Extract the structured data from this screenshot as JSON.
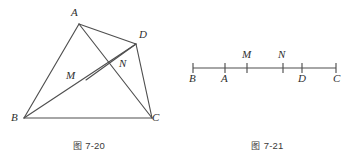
{
  "page": {
    "width": 357,
    "height": 164,
    "background": "#ffffff",
    "ink_color": "#4a4a4a",
    "label_color": "#2e2e2e"
  },
  "figures": [
    {
      "id": "figure-7-20",
      "caption": "图 7-20",
      "caption_cjk": "图",
      "caption_number": "7-20",
      "type": "geometry-diagram",
      "description": "Quadrilateral ABDC with cevians; M and N are interior intersection points",
      "points": [
        {
          "name": "A",
          "label": "A",
          "x": 79,
          "y": 24,
          "label_x": 71,
          "label_y": 7
        },
        {
          "name": "D",
          "label": "D",
          "x": 136,
          "y": 44,
          "label_x": 139,
          "label_y": 29
        },
        {
          "name": "N",
          "label": "N",
          "x": 115,
          "y": 67,
          "label_x": 119,
          "label_y": 58
        },
        {
          "name": "M",
          "label": "M",
          "x": 86,
          "y": 80,
          "label_x": 68,
          "label_y": 70
        },
        {
          "name": "B",
          "label": "B",
          "x": 24,
          "y": 118,
          "label_x": 12,
          "label_y": 113
        },
        {
          "name": "C",
          "label": "C",
          "x": 152,
          "y": 118,
          "label_x": 152,
          "label_y": 113
        }
      ],
      "segments": [
        {
          "from": "B",
          "to": "A",
          "name": "segment-BA"
        },
        {
          "from": "B",
          "to": "C",
          "name": "segment-BC"
        },
        {
          "from": "A",
          "to": "D",
          "name": "segment-AD"
        },
        {
          "from": "D",
          "to": "C",
          "name": "segment-DC"
        },
        {
          "from": "A",
          "to": "C",
          "name": "segment-AC"
        },
        {
          "from": "B",
          "to": "D",
          "name": "segment-BD"
        },
        {
          "from": "M",
          "to": "D",
          "name": "segment-MD"
        }
      ]
    },
    {
      "id": "figure-7-21",
      "caption": "图 7-21",
      "caption_cjk": "图",
      "caption_number": "7-21",
      "type": "number-line-diagram",
      "description": "Straight line with marked points B, A, M, N, D, C in order",
      "line": {
        "x1": 15,
        "y1": 68,
        "x2": 158,
        "y2": 68
      },
      "ticks": [
        {
          "name": "B",
          "label": "B",
          "x": 15,
          "label_side": "below"
        },
        {
          "name": "A",
          "label": "A",
          "x": 47,
          "label_side": "below"
        },
        {
          "name": "M",
          "label": "M",
          "x": 69,
          "label_side": "above"
        },
        {
          "name": "N",
          "label": "N",
          "x": 105,
          "label_side": "above"
        },
        {
          "name": "D",
          "label": "D",
          "x": 124,
          "label_side": "below"
        },
        {
          "name": "C",
          "label": "C",
          "x": 158,
          "label_side": "below"
        }
      ]
    }
  ]
}
